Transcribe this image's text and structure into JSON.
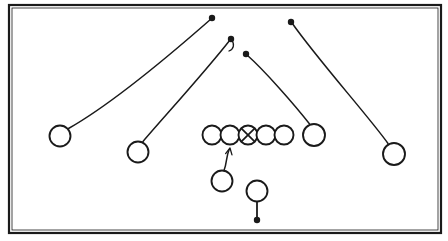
{
  "diagram": {
    "type": "american-football-play-schematic",
    "background_color": "#ffffff",
    "stroke_color": "#1a1a1a",
    "frame": {
      "x": 9,
      "y": 5,
      "width": 432,
      "height": 228,
      "outer_stroke_width": 2.2,
      "inner_stroke_width": 0.8,
      "inner_inset": 3
    },
    "players": [
      {
        "id": "wr-left-outside",
        "label": "",
        "role": "wide-receiver",
        "marker": "circle",
        "cx": 60,
        "cy": 136,
        "r": 10.5
      },
      {
        "id": "wr-left-slot",
        "label": "",
        "role": "slot-receiver",
        "marker": "circle",
        "cx": 138,
        "cy": 152,
        "r": 10.5
      },
      {
        "id": "ol-left-tackle",
        "label": "",
        "role": "offensive-line",
        "marker": "circle",
        "cx": 212,
        "cy": 135,
        "r": 9.5
      },
      {
        "id": "ol-left-guard",
        "label": "",
        "role": "offensive-line",
        "marker": "circle",
        "cx": 230,
        "cy": 135,
        "r": 9.5
      },
      {
        "id": "ol-center",
        "label": "",
        "role": "center",
        "marker": "circle-x",
        "cx": 248,
        "cy": 135,
        "r": 9.5
      },
      {
        "id": "ol-right-guard",
        "label": "",
        "role": "offensive-line",
        "marker": "circle",
        "cx": 266,
        "cy": 135,
        "r": 9.5
      },
      {
        "id": "ol-right-tackle",
        "label": "",
        "role": "offensive-line",
        "marker": "circle",
        "cx": 284,
        "cy": 135,
        "r": 9.5
      },
      {
        "id": "ol-tight-end",
        "label": "",
        "role": "tight-end",
        "marker": "circle",
        "cx": 314,
        "cy": 135,
        "r": 11
      },
      {
        "id": "wr-right-outside",
        "label": "",
        "role": "wide-receiver",
        "marker": "circle",
        "cx": 394,
        "cy": 154,
        "r": 11
      },
      {
        "id": "running-back",
        "label": "",
        "role": "running-back",
        "marker": "circle",
        "cx": 222,
        "cy": 181,
        "r": 10.5
      },
      {
        "id": "quarterback",
        "label": "",
        "role": "quarterback",
        "marker": "circle",
        "cx": 257,
        "cy": 191,
        "r": 10.5
      }
    ],
    "routes": [
      {
        "id": "route-wr-left-outside",
        "from_player": "wr-left-outside",
        "end_marker": "dot",
        "path": "M 68.5 128.5 C 110 105, 170 55, 211 19",
        "end_x": 212,
        "end_y": 18,
        "stroke_width": 1.5
      },
      {
        "id": "route-wr-left-slot",
        "from_player": "wr-left-slot",
        "end_marker": "dot-with-hook",
        "path": "M 143 141.5 C 163 118, 205 72, 230 40",
        "end_x": 231,
        "end_y": 39,
        "hook_path": "M 231 39 C 235 44, 234 49, 229 51",
        "stroke_width": 1.5
      },
      {
        "id": "route-tight-end",
        "from_player": "ol-tight-end",
        "end_marker": "dot",
        "path": "M 310 124.5 C 294 104, 264 70, 247 55",
        "end_x": 246,
        "end_y": 54,
        "stroke_width": 1.5
      },
      {
        "id": "route-wr-right-outside",
        "from_player": "wr-right-outside",
        "end_marker": "dot",
        "path": "M 388 143.5 C 370 118, 318 60, 292 23",
        "end_x": 291,
        "end_y": 22,
        "stroke_width": 1.5
      },
      {
        "id": "route-running-back",
        "from_player": "running-back",
        "end_marker": "arrowhead",
        "path": "M 224 170.5 C 227 163, 226 157, 229 150",
        "end_x": 230,
        "end_y": 148,
        "stroke_width": 1.5
      },
      {
        "id": "route-quarterback",
        "from_player": "quarterback",
        "end_marker": "dot",
        "path": "M 257 201.5 L 257 218",
        "end_x": 257,
        "end_y": 220,
        "stroke_width": 1.8
      }
    ],
    "markers": {
      "dot_radius": 3.2,
      "arrow_size": 5.5
    }
  }
}
